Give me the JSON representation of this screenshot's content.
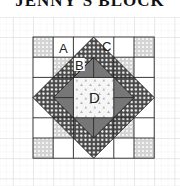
{
  "title": "JENNY'S BLOCK",
  "labels": {
    "a": "A",
    "b": "B",
    "c": "C",
    "d": "D"
  },
  "colors": {
    "grid_light": "#e6e6e6",
    "grid_heavy": "#d2d2d2",
    "outline": "#222222",
    "dark_fabric": "#555555",
    "medium_gray": "#7a7a7a",
    "light_dotted": "#cfcfcf",
    "center": "#f4f4f4"
  }
}
